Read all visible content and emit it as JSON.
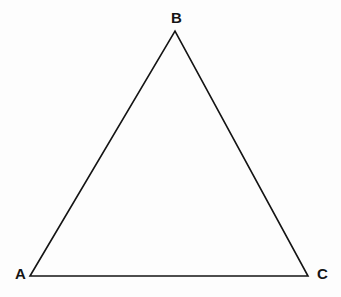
{
  "figure": {
    "kind": "geometry-diagram",
    "shape": "triangle",
    "background_color": "#fdfdfd",
    "stroke_color": "#141414",
    "stroke_width": 1.6,
    "fill": "none",
    "width": 341,
    "height": 297,
    "vertices": [
      {
        "id": "A",
        "label": "A",
        "x": 30,
        "y": 276,
        "label_x": 20,
        "label_y": 273,
        "label_position": "left"
      },
      {
        "id": "B",
        "label": "B",
        "x": 175,
        "y": 31,
        "label_x": 176,
        "label_y": 17,
        "label_position": "above"
      },
      {
        "id": "C",
        "label": "C",
        "x": 308,
        "y": 276,
        "label_x": 322,
        "label_y": 273,
        "label_position": "right"
      }
    ],
    "edges": [
      {
        "id": "AB",
        "from": "A",
        "to": "B"
      },
      {
        "id": "BC",
        "from": "B",
        "to": "C"
      },
      {
        "id": "CA",
        "from": "C",
        "to": "A"
      }
    ],
    "path": "M 30 276 L 175 31 L 308 276 Z"
  }
}
